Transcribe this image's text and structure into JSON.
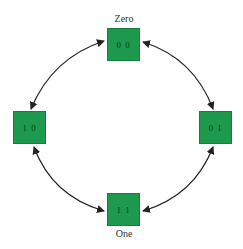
{
  "diagram": {
    "type": "state-transition-cycle",
    "colors": {
      "state_fill": "#1d9a4e",
      "state_text": "#0b3b1c",
      "arrow": "#222222",
      "label": "#333333"
    },
    "states": [
      {
        "id": "top",
        "value": "0 0",
        "label": "Zero"
      },
      {
        "id": "right",
        "value": "0 1",
        "label": ""
      },
      {
        "id": "bottom",
        "value": "1 1",
        "label": "One"
      },
      {
        "id": "left",
        "value": "1 0",
        "label": ""
      }
    ],
    "transitions": [
      {
        "from": "0 0",
        "to": "1 0",
        "bidirectional": true
      },
      {
        "from": "0 0",
        "to": "0 1",
        "bidirectional": true
      },
      {
        "from": "1 0",
        "to": "1 1",
        "bidirectional": true
      },
      {
        "from": "0 1",
        "to": "1 1",
        "bidirectional": true
      }
    ]
  }
}
